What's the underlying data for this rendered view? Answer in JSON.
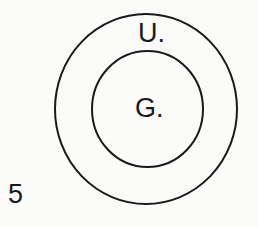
{
  "figure": {
    "number": "5",
    "type": "nested-circles (Euler diagram)",
    "stroke_color": "#1a1a1a",
    "background": "#fbfbfa",
    "outer_circle": {
      "label": "U.",
      "cx": 146,
      "cy": 109,
      "rx": 91,
      "ry": 95
    },
    "inner_circle": {
      "label": "G.",
      "cx": 147.5,
      "cy": 109,
      "rx": 55.5,
      "ry": 58
    }
  }
}
